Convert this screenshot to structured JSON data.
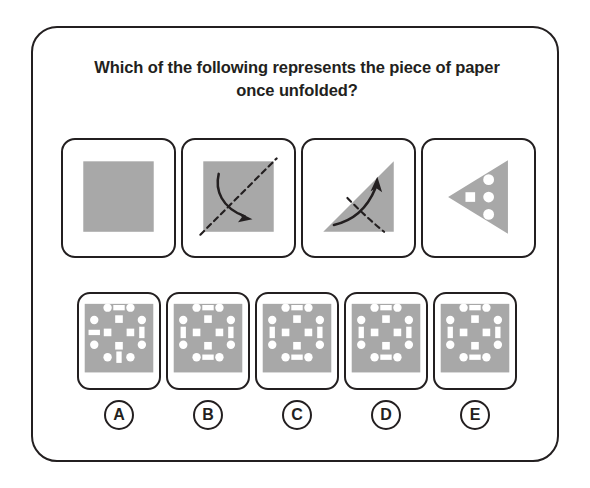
{
  "question": {
    "text": "Which of the following represents the piece of paper once unfolded?"
  },
  "colors": {
    "paper_gray": "#a8a8a8",
    "hole_white": "#ffffff",
    "ink": "#231f20",
    "card_background": "#ffffff"
  },
  "fold_sequence": {
    "panels": [
      {
        "id": "step-1",
        "name": "unfolded-square",
        "shape": "square",
        "fill": "#a8a8a8",
        "fold_line": null,
        "arrow": null
      },
      {
        "id": "step-2",
        "name": "square-with-diagonal-fold",
        "shape": "square",
        "fill": "#a8a8a8",
        "fold_line": "diagonal-bottom-left-to-top-right",
        "arrow": "curved-arrow-pointing-down-right"
      },
      {
        "id": "step-3",
        "name": "triangle-with-fold",
        "shape": "triangle-right-angle-bottom-left",
        "fill": "#a8a8a8",
        "fold_line": "dashed-curve-lower-right",
        "arrow": "curved-arrow-pointing-up"
      },
      {
        "id": "step-4",
        "name": "punched-triangle",
        "shape": "triangle-pointing-left",
        "fill": "#a8a8a8",
        "holes": [
          {
            "type": "square",
            "x": -0.34,
            "y": 0.0,
            "size": 0.16
          },
          {
            "type": "circle",
            "x": 0.1,
            "y": -0.36,
            "size": 0.17
          },
          {
            "type": "circle",
            "x": 0.1,
            "y": 0.02,
            "size": 0.17
          },
          {
            "type": "circle",
            "x": 0.1,
            "y": 0.38,
            "size": 0.17
          }
        ]
      }
    ]
  },
  "options": [
    {
      "letter": "A",
      "name": "option-a",
      "holes": [
        {
          "type": "circle",
          "cx": 30,
          "cy": 14,
          "r": 4.4
        },
        {
          "type": "rect",
          "cx": 42,
          "cy": 14,
          "w": 12,
          "h": 5.6
        },
        {
          "type": "circle",
          "cx": 54,
          "cy": 14,
          "r": 4.4
        },
        {
          "type": "circle",
          "cx": 16,
          "cy": 27,
          "r": 4.4
        },
        {
          "type": "rect",
          "cx": 42,
          "cy": 26,
          "w": 8,
          "h": 8
        },
        {
          "type": "circle",
          "cx": 66,
          "cy": 27,
          "r": 4.4
        },
        {
          "type": "rect",
          "cx": 16,
          "cy": 40,
          "w": 12,
          "h": 5.6
        },
        {
          "type": "rect",
          "cx": 30,
          "cy": 40,
          "w": 8,
          "h": 8
        },
        {
          "type": "rect",
          "cx": 54,
          "cy": 40,
          "w": 8,
          "h": 8
        },
        {
          "type": "rect",
          "cx": 66,
          "cy": 40,
          "w": 5.6,
          "h": 12
        },
        {
          "type": "circle",
          "cx": 16,
          "cy": 53,
          "r": 4.4
        },
        {
          "type": "rect",
          "cx": 42,
          "cy": 54,
          "w": 8,
          "h": 8
        },
        {
          "type": "circle",
          "cx": 66,
          "cy": 53,
          "r": 4.4
        },
        {
          "type": "circle",
          "cx": 30,
          "cy": 66,
          "r": 4.4
        },
        {
          "type": "rect",
          "cx": 42,
          "cy": 66,
          "w": 5.6,
          "h": 12
        },
        {
          "type": "circle",
          "cx": 54,
          "cy": 66,
          "r": 4.4
        }
      ]
    },
    {
      "letter": "B",
      "name": "option-b",
      "holes": [
        {
          "type": "circle",
          "cx": 30,
          "cy": 14,
          "r": 4.4
        },
        {
          "type": "rect",
          "cx": 42,
          "cy": 14,
          "w": 12,
          "h": 5.6
        },
        {
          "type": "circle",
          "cx": 54,
          "cy": 14,
          "r": 4.4
        },
        {
          "type": "circle",
          "cx": 16,
          "cy": 27,
          "r": 4.4
        },
        {
          "type": "rect",
          "cx": 42,
          "cy": 26,
          "w": 8,
          "h": 8
        },
        {
          "type": "circle",
          "cx": 66,
          "cy": 27,
          "r": 4.4
        },
        {
          "type": "rect",
          "cx": 16,
          "cy": 40,
          "w": 5.6,
          "h": 12
        },
        {
          "type": "rect",
          "cx": 30,
          "cy": 40,
          "w": 8,
          "h": 8
        },
        {
          "type": "rect",
          "cx": 54,
          "cy": 40,
          "w": 8,
          "h": 8
        },
        {
          "type": "rect",
          "cx": 66,
          "cy": 40,
          "w": 5.6,
          "h": 12
        },
        {
          "type": "circle",
          "cx": 16,
          "cy": 53,
          "r": 4.4
        },
        {
          "type": "rect",
          "cx": 42,
          "cy": 54,
          "w": 8,
          "h": 8
        },
        {
          "type": "circle",
          "cx": 66,
          "cy": 53,
          "r": 4.4
        },
        {
          "type": "circle",
          "cx": 30,
          "cy": 66,
          "r": 4.4
        },
        {
          "type": "rect",
          "cx": 42,
          "cy": 66,
          "w": 12,
          "h": 5.6
        },
        {
          "type": "circle",
          "cx": 54,
          "cy": 66,
          "r": 4.4
        }
      ]
    },
    {
      "letter": "C",
      "name": "option-c",
      "holes": [
        {
          "type": "circle",
          "cx": 30,
          "cy": 14,
          "r": 4.4
        },
        {
          "type": "rect",
          "cx": 42,
          "cy": 14,
          "w": 12,
          "h": 5.6
        },
        {
          "type": "circle",
          "cx": 54,
          "cy": 14,
          "r": 4.4
        },
        {
          "type": "circle",
          "cx": 16,
          "cy": 27,
          "r": 4.4
        },
        {
          "type": "rect",
          "cx": 42,
          "cy": 26,
          "w": 8,
          "h": 8
        },
        {
          "type": "circle",
          "cx": 66,
          "cy": 27,
          "r": 4.4
        },
        {
          "type": "rect",
          "cx": 16,
          "cy": 40,
          "w": 5.6,
          "h": 12
        },
        {
          "type": "rect",
          "cx": 30,
          "cy": 40,
          "w": 8,
          "h": 8
        },
        {
          "type": "rect",
          "cx": 54,
          "cy": 40,
          "w": 8,
          "h": 8
        },
        {
          "type": "rect",
          "cx": 66,
          "cy": 40,
          "w": 5.6,
          "h": 12
        },
        {
          "type": "circle",
          "cx": 16,
          "cy": 53,
          "r": 4.4
        },
        {
          "type": "rect",
          "cx": 42,
          "cy": 54,
          "w": 8,
          "h": 8
        },
        {
          "type": "circle",
          "cx": 66,
          "cy": 53,
          "r": 4.4
        },
        {
          "type": "circle",
          "cx": 30,
          "cy": 66,
          "r": 4.4
        },
        {
          "type": "rect",
          "cx": 42,
          "cy": 66,
          "w": 12,
          "h": 5.6
        },
        {
          "type": "circle",
          "cx": 54,
          "cy": 66,
          "r": 4.4
        }
      ]
    },
    {
      "letter": "D",
      "name": "option-d",
      "holes": [
        {
          "type": "circle",
          "cx": 30,
          "cy": 14,
          "r": 4.4
        },
        {
          "type": "rect",
          "cx": 42,
          "cy": 14,
          "w": 12,
          "h": 5.6
        },
        {
          "type": "circle",
          "cx": 54,
          "cy": 14,
          "r": 4.4
        },
        {
          "type": "circle",
          "cx": 16,
          "cy": 27,
          "r": 4.4
        },
        {
          "type": "rect",
          "cx": 42,
          "cy": 26,
          "w": 8,
          "h": 8
        },
        {
          "type": "circle",
          "cx": 66,
          "cy": 27,
          "r": 4.4
        },
        {
          "type": "rect",
          "cx": 16,
          "cy": 40,
          "w": 5.6,
          "h": 12
        },
        {
          "type": "rect",
          "cx": 30,
          "cy": 40,
          "w": 8,
          "h": 8
        },
        {
          "type": "rect",
          "cx": 54,
          "cy": 40,
          "w": 8,
          "h": 8
        },
        {
          "type": "rect",
          "cx": 66,
          "cy": 40,
          "w": 5.6,
          "h": 12
        },
        {
          "type": "circle",
          "cx": 16,
          "cy": 53,
          "r": 4.4
        },
        {
          "type": "rect",
          "cx": 42,
          "cy": 54,
          "w": 8,
          "h": 8
        },
        {
          "type": "circle",
          "cx": 66,
          "cy": 53,
          "r": 4.4
        },
        {
          "type": "circle",
          "cx": 30,
          "cy": 66,
          "r": 4.4
        },
        {
          "type": "rect",
          "cx": 42,
          "cy": 66,
          "w": 12,
          "h": 5.6
        },
        {
          "type": "circle",
          "cx": 54,
          "cy": 66,
          "r": 4.4
        }
      ]
    },
    {
      "letter": "E",
      "name": "option-e",
      "holes": [
        {
          "type": "circle",
          "cx": 30,
          "cy": 14,
          "r": 4.4
        },
        {
          "type": "rect",
          "cx": 42,
          "cy": 14,
          "w": 12,
          "h": 5.6
        },
        {
          "type": "circle",
          "cx": 54,
          "cy": 14,
          "r": 4.4
        },
        {
          "type": "circle",
          "cx": 16,
          "cy": 27,
          "r": 4.4
        },
        {
          "type": "rect",
          "cx": 42,
          "cy": 26,
          "w": 8,
          "h": 8
        },
        {
          "type": "circle",
          "cx": 66,
          "cy": 27,
          "r": 4.4
        },
        {
          "type": "rect",
          "cx": 16,
          "cy": 40,
          "w": 5.6,
          "h": 12
        },
        {
          "type": "rect",
          "cx": 30,
          "cy": 40,
          "w": 8,
          "h": 8
        },
        {
          "type": "rect",
          "cx": 54,
          "cy": 40,
          "w": 8,
          "h": 8
        },
        {
          "type": "rect",
          "cx": 66,
          "cy": 40,
          "w": 5.6,
          "h": 12
        },
        {
          "type": "circle",
          "cx": 16,
          "cy": 53,
          "r": 4.4
        },
        {
          "type": "rect",
          "cx": 42,
          "cy": 54,
          "w": 8,
          "h": 8
        },
        {
          "type": "circle",
          "cx": 66,
          "cy": 53,
          "r": 4.4
        },
        {
          "type": "circle",
          "cx": 30,
          "cy": 66,
          "r": 4.4
        },
        {
          "type": "rect",
          "cx": 42,
          "cy": 66,
          "w": 12,
          "h": 5.6
        },
        {
          "type": "circle",
          "cx": 54,
          "cy": 66,
          "r": 4.4
        }
      ]
    }
  ]
}
